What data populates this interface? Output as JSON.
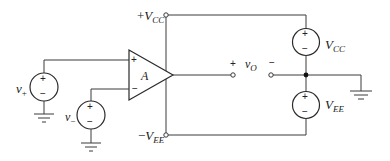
{
  "diagram": {
    "labels": {
      "vcc_terminal": {
        "sign": "+",
        "main": "V",
        "sub": "CC"
      },
      "vee_terminal": {
        "sign": "−",
        "main": "V",
        "sub": "EE"
      },
      "opamp_gain": "A",
      "opamp_noninverting": "+",
      "opamp_inverting": "−",
      "v_plus": {
        "main": "v",
        "sub": "+"
      },
      "v_minus": {
        "main": "v",
        "sub": "−"
      },
      "v_out": {
        "main": "v",
        "sub": "O"
      },
      "v_out_plus": "+",
      "v_out_minus": "−",
      "vcc_source": {
        "main": "V",
        "sub": "CC"
      },
      "vee_source": {
        "main": "V",
        "sub": "EE"
      },
      "source_plus": "+",
      "source_minus": "−"
    },
    "colors": {
      "wire": "#3a3a3a",
      "text": "#222222",
      "background": "#ffffff"
    }
  }
}
